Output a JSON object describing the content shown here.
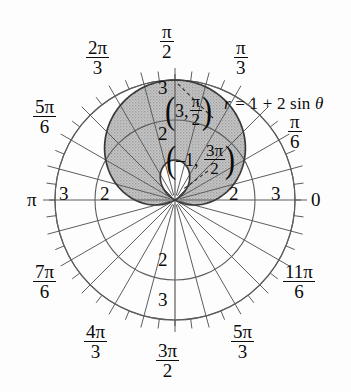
{
  "figure": {
    "kind": "polar-plot",
    "title_equation": "r = 1 + 2 sin θ",
    "background_color": "#fdfdfd",
    "grid_color": "#595959",
    "fill_color": "#b9b9b9",
    "curve_color": "#3a3a3a",
    "text_color": "#0b0b0b"
  },
  "equation": {
    "lhs": "r",
    "eq": "=",
    "rhs": "1 + 2 sin",
    "theta": "θ",
    "full": "r = 1 + 2 sin θ"
  },
  "axis_labels": {
    "zero": "0",
    "pi": "π"
  },
  "angle_labels": [
    {
      "name": "pi-over-6",
      "deg": 30,
      "num": "π",
      "den": "6",
      "text": "π/6"
    },
    {
      "name": "pi-over-3",
      "deg": 60,
      "num": "π",
      "den": "3",
      "text": "π/3"
    },
    {
      "name": "pi-over-2",
      "deg": 90,
      "num": "π",
      "den": "2",
      "text": "π/2"
    },
    {
      "name": "two-pi-over-3",
      "deg": 120,
      "num": "2π",
      "den": "3",
      "text": "2π/3"
    },
    {
      "name": "five-pi-over-6",
      "deg": 150,
      "num": "5π",
      "den": "6",
      "text": "5π/6"
    },
    {
      "name": "seven-pi-over-6",
      "deg": 210,
      "num": "7π",
      "den": "6",
      "text": "7π/6"
    },
    {
      "name": "four-pi-over-3",
      "deg": 240,
      "num": "4π",
      "den": "3",
      "text": "4π/3"
    },
    {
      "name": "three-pi-over-2",
      "deg": 270,
      "num": "3π",
      "den": "2",
      "text": "3π/2"
    },
    {
      "name": "five-pi-over-3",
      "deg": 300,
      "num": "5π",
      "den": "3",
      "text": "5π/3"
    },
    {
      "name": "eleven-pi-over-6",
      "deg": 330,
      "num": "11π",
      "den": "6",
      "text": "11π/6"
    }
  ],
  "radial_ticks": {
    "values": [
      2,
      3
    ],
    "labels": [
      "2",
      "3"
    ],
    "label_right_2": "2",
    "label_right_3": "3",
    "label_left_2": "2",
    "label_left_3": "3",
    "label_up_2": "2",
    "label_up_3": "3",
    "label_down_2": "2",
    "label_down_3": "3"
  },
  "points": [
    {
      "name": "max-point",
      "r": "3",
      "theta_num": "π",
      "theta_den": "2",
      "text": "(3, π/2)"
    },
    {
      "name": "inner-loop-point",
      "r": "–1",
      "theta_num": "3π",
      "theta_den": "2",
      "text": "(–1, 3π/2)"
    }
  ],
  "chart_data": {
    "type": "line",
    "plot_kind": "polar",
    "title": "r = 1 + 2 sin θ",
    "xlabel": "",
    "ylabel": "",
    "equation": "r = 1 + 2 sin(theta)",
    "curve_family": "limacon with inner loop",
    "theta_range_deg": [
      0,
      360
    ],
    "r_max": 3,
    "r_min": -1,
    "grid": true,
    "legend": "none",
    "radial_gridlines_r": [
      1,
      2,
      3
    ],
    "radial_labeled_r": [
      2,
      3
    ],
    "angular_gridline_step_deg": 15,
    "minor_tick_step_deg": 7.5,
    "annotations": [
      {
        "label": "(3, π/2)",
        "r": 3,
        "theta_deg": 90
      },
      {
        "label": "(–1, 3π/2)",
        "r": -1,
        "theta_deg": 270
      }
    ],
    "shaded_region": {
      "description": "interior of outer loop above and around pole",
      "fill": "#b9b9b9"
    },
    "theta_deg": [
      0,
      10,
      20,
      30,
      40,
      50,
      60,
      70,
      80,
      90,
      100,
      110,
      120,
      130,
      140,
      150,
      160,
      170,
      180,
      190,
      200,
      210,
      220,
      230,
      240,
      250,
      260,
      270,
      280,
      290,
      300,
      310,
      320,
      330,
      340,
      350,
      360
    ],
    "r_values": [
      1.0,
      1.35,
      1.68,
      2.0,
      2.29,
      2.53,
      2.73,
      2.88,
      2.97,
      3.0,
      2.97,
      2.88,
      2.73,
      2.53,
      2.29,
      2.0,
      1.68,
      1.35,
      1.0,
      0.65,
      0.32,
      0.0,
      -0.29,
      -0.53,
      -0.73,
      -0.88,
      -0.97,
      -1.0,
      -0.97,
      -0.88,
      -0.73,
      -0.53,
      -0.29,
      0.0,
      0.32,
      0.65,
      1.0
    ]
  }
}
